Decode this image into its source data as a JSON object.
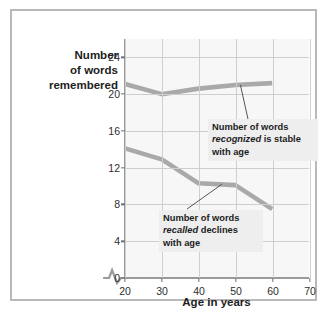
{
  "chart_data": {
    "type": "line",
    "title": "",
    "xlabel": "Age in years",
    "ylabel": "Number of words remembered",
    "ylabel_lines": [
      "Number",
      "of words",
      "remembered"
    ],
    "xlim": [
      20,
      70
    ],
    "ylim": [
      0,
      26
    ],
    "xticks": [
      20,
      30,
      40,
      50,
      60,
      70
    ],
    "yticks": [
      0,
      4,
      8,
      12,
      16,
      20,
      24
    ],
    "grid": true,
    "legend": "none",
    "axis_break_y": true,
    "line_color": "#a9a9a9",
    "plot_background": "#f7f7f7",
    "grid_color": "#cfcfcf",
    "x": [
      20,
      30,
      40,
      50,
      60
    ],
    "series": [
      {
        "name": "Number of words recognized",
        "values": [
          21.1,
          20.0,
          20.6,
          21.0,
          21.2
        ]
      },
      {
        "name": "Number of words recalled",
        "values": [
          14.1,
          12.9,
          10.3,
          10.1,
          7.5
        ]
      }
    ],
    "annotations": [
      {
        "id": "recognized",
        "text_before": "Number of words ",
        "emphasis": "recognized",
        "text_after": " is stable with age",
        "points_to_x": 52,
        "points_to_y": 21.0
      },
      {
        "id": "recalled",
        "text_before": "Number of words ",
        "emphasis": "recalled",
        "text_after": " declines with age",
        "points_to_x": 47,
        "points_to_y": 10.2
      }
    ]
  }
}
